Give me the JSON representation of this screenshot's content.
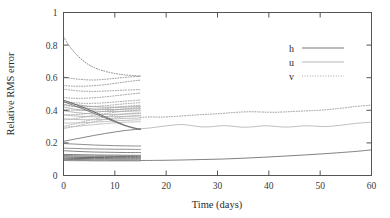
{
  "chart_data": {
    "type": "line",
    "title": "",
    "subtitle": "",
    "xlabel": "Time (days)",
    "ylabel": "Relative RMS error",
    "xlim": [
      0,
      60
    ],
    "ylim": [
      0,
      1
    ],
    "xticks": [
      0,
      10,
      20,
      30,
      40,
      50,
      60
    ],
    "xtick_labels": [
      "0",
      "10",
      "20",
      "30",
      "40",
      "50",
      "60"
    ],
    "yticks": [
      0,
      0.2,
      0.4,
      0.6,
      0.8,
      1
    ],
    "ytick_labels": [
      "0",
      "0.2",
      "0.4",
      "0.6",
      "0.8",
      "1"
    ],
    "grid": false,
    "legend_position": "upper right",
    "legend": [
      {
        "name": "h",
        "style": "solid",
        "color": "#606060"
      },
      {
        "name": "u",
        "style": "solid",
        "color": "#a8a8a8"
      },
      {
        "name": "v",
        "style": "dotted",
        "color": "#909090"
      }
    ],
    "series": [
      {
        "name": "v-forecast",
        "variable": "v",
        "style": "dotted",
        "color": "#8f8f8f",
        "x": [
          15,
          17,
          19,
          21,
          23,
          25,
          27,
          29,
          31,
          33,
          35,
          37,
          39,
          41,
          43,
          45,
          47,
          49,
          51,
          53,
          55,
          57,
          60
        ],
        "y": [
          0.357,
          0.359,
          0.358,
          0.361,
          0.365,
          0.37,
          0.374,
          0.377,
          0.381,
          0.386,
          0.39,
          0.391,
          0.389,
          0.388,
          0.39,
          0.393,
          0.396,
          0.399,
          0.403,
          0.409,
          0.416,
          0.424,
          0.432
        ]
      },
      {
        "name": "u-forecast",
        "variable": "u",
        "style": "solid",
        "color": "#b4b4b4",
        "x": [
          15,
          17,
          19,
          21,
          23,
          25,
          27,
          29,
          31,
          33,
          35,
          37,
          39,
          41,
          43,
          45,
          47,
          49,
          51,
          53,
          55,
          57,
          60
        ],
        "y": [
          0.287,
          0.292,
          0.301,
          0.308,
          0.313,
          0.306,
          0.298,
          0.3,
          0.306,
          0.302,
          0.296,
          0.299,
          0.305,
          0.302,
          0.297,
          0.3,
          0.305,
          0.303,
          0.3,
          0.305,
          0.312,
          0.32,
          0.327
        ]
      },
      {
        "name": "h-forecast",
        "variable": "h",
        "style": "solid",
        "color": "#6a6a6a",
        "x": [
          15,
          19,
          23,
          27,
          31,
          35,
          39,
          43,
          47,
          51,
          55,
          57,
          60
        ],
        "y": [
          0.092,
          0.093,
          0.095,
          0.098,
          0.101,
          0.106,
          0.112,
          0.119,
          0.126,
          0.134,
          0.143,
          0.148,
          0.157
        ]
      },
      {
        "name": "v-ensemble-1",
        "variable": "v",
        "style": "dotted",
        "color": "#7d7d7d",
        "x": [
          0,
          1,
          2,
          3,
          4,
          5,
          6,
          7,
          8,
          9,
          10,
          11,
          12,
          13,
          14,
          15
        ],
        "y": [
          0.852,
          0.8,
          0.76,
          0.727,
          0.7,
          0.678,
          0.662,
          0.65,
          0.64,
          0.632,
          0.626,
          0.621,
          0.617,
          0.614,
          0.612,
          0.61
        ]
      },
      {
        "name": "v-ensemble-2",
        "variable": "v",
        "style": "dotted",
        "color": "#8a8a8a",
        "x": [
          0,
          2,
          4,
          6,
          8,
          10,
          12,
          14,
          15
        ],
        "y": [
          0.604,
          0.594,
          0.588,
          0.586,
          0.59,
          0.596,
          0.602,
          0.607,
          0.609
        ]
      },
      {
        "name": "v-ensemble-3",
        "variable": "v",
        "style": "dotted",
        "color": "#8a8a8a",
        "x": [
          0,
          2,
          4,
          6,
          8,
          10,
          12,
          14,
          15
        ],
        "y": [
          0.552,
          0.548,
          0.548,
          0.551,
          0.557,
          0.565,
          0.574,
          0.582,
          0.585
        ]
      },
      {
        "name": "v-ensemble-4",
        "variable": "v",
        "style": "dotted",
        "color": "#8f8f8f",
        "x": [
          0,
          2,
          4,
          6,
          8,
          10,
          12,
          14,
          15
        ],
        "y": [
          0.53,
          0.522,
          0.517,
          0.516,
          0.518,
          0.521,
          0.524,
          0.526,
          0.527
        ]
      },
      {
        "name": "v-ensemble-5",
        "variable": "v",
        "style": "dotted",
        "color": "#8f8f8f",
        "x": [
          0,
          2,
          4,
          6,
          8,
          10,
          12,
          14,
          15
        ],
        "y": [
          0.478,
          0.474,
          0.474,
          0.477,
          0.482,
          0.489,
          0.496,
          0.503,
          0.506
        ]
      },
      {
        "name": "v-ensemble-6",
        "variable": "v",
        "style": "dotted",
        "color": "#949494",
        "x": [
          0,
          2,
          4,
          6,
          8,
          10,
          12,
          14,
          15
        ],
        "y": [
          0.455,
          0.447,
          0.443,
          0.443,
          0.446,
          0.451,
          0.456,
          0.461,
          0.463
        ]
      },
      {
        "name": "v-ensemble-7",
        "variable": "v",
        "style": "dotted",
        "color": "#949494",
        "x": [
          0,
          2,
          4,
          6,
          8,
          10,
          12,
          14,
          15
        ],
        "y": [
          0.43,
          0.424,
          0.422,
          0.424,
          0.428,
          0.434,
          0.44,
          0.445,
          0.447
        ]
      },
      {
        "name": "v-ensemble-8",
        "variable": "v",
        "style": "dotted",
        "color": "#9a9a9a",
        "x": [
          0,
          2,
          4,
          6,
          8,
          10,
          12,
          14,
          15
        ],
        "y": [
          0.404,
          0.4,
          0.4,
          0.404,
          0.41,
          0.417,
          0.424,
          0.429,
          0.431
        ]
      },
      {
        "name": "v-ensemble-9",
        "variable": "v",
        "style": "dotted",
        "color": "#9a9a9a",
        "x": [
          0,
          2,
          4,
          6,
          8,
          10,
          12,
          14,
          15
        ],
        "y": [
          0.372,
          0.373,
          0.378,
          0.386,
          0.394,
          0.402,
          0.409,
          0.414,
          0.416
        ]
      },
      {
        "name": "v-ensemble-10",
        "variable": "v",
        "style": "dotted",
        "color": "#9f9f9f",
        "x": [
          0,
          2,
          4,
          6,
          8,
          10,
          12,
          14,
          15
        ],
        "y": [
          0.341,
          0.348,
          0.358,
          0.369,
          0.379,
          0.388,
          0.395,
          0.4,
          0.402
        ]
      },
      {
        "name": "v-ensemble-11",
        "variable": "v",
        "style": "dotted",
        "color": "#9f9f9f",
        "x": [
          0,
          2,
          4,
          6,
          8,
          10,
          12,
          14,
          15
        ],
        "y": [
          0.302,
          0.315,
          0.331,
          0.346,
          0.359,
          0.37,
          0.378,
          0.383,
          0.385
        ]
      },
      {
        "name": "v-ensemble-12",
        "variable": "v",
        "style": "dotted",
        "color": "#a4a4a4",
        "x": [
          0,
          2,
          4,
          6,
          8,
          10,
          12,
          14,
          15
        ],
        "y": [
          0.287,
          0.3,
          0.315,
          0.33,
          0.343,
          0.353,
          0.361,
          0.366,
          0.368
        ]
      },
      {
        "name": "u-ensemble-1",
        "variable": "u",
        "style": "solid",
        "color": "#9e9e9e",
        "x": [
          0,
          2,
          4,
          6,
          8,
          10,
          12,
          14,
          15
        ],
        "y": [
          0.452,
          0.438,
          0.428,
          0.422,
          0.419,
          0.419,
          0.42,
          0.422,
          0.423
        ]
      },
      {
        "name": "u-ensemble-2",
        "variable": "u",
        "style": "solid",
        "color": "#a3a3a3",
        "x": [
          0,
          2,
          4,
          6,
          8,
          10,
          12,
          14,
          15
        ],
        "y": [
          0.438,
          0.424,
          0.414,
          0.408,
          0.405,
          0.405,
          0.407,
          0.409,
          0.41
        ]
      },
      {
        "name": "u-ensemble-3",
        "variable": "u",
        "style": "solid",
        "color": "#a8a8a8",
        "x": [
          0,
          2,
          4,
          6,
          8,
          10,
          12,
          14,
          15
        ],
        "y": [
          0.42,
          0.408,
          0.4,
          0.395,
          0.393,
          0.393,
          0.394,
          0.396,
          0.397
        ]
      },
      {
        "name": "u-ensemble-4",
        "variable": "u",
        "style": "solid",
        "color": "#adadad",
        "x": [
          0,
          2,
          4,
          6,
          8,
          10,
          12,
          14,
          15
        ],
        "y": [
          0.398,
          0.388,
          0.381,
          0.377,
          0.375,
          0.375,
          0.377,
          0.379,
          0.38
        ]
      },
      {
        "name": "u-ensemble-5",
        "variable": "u",
        "style": "solid",
        "color": "#b0b0b0",
        "x": [
          0,
          2,
          4,
          6,
          8,
          10,
          12,
          14,
          15
        ],
        "y": [
          0.372,
          0.366,
          0.362,
          0.36,
          0.36,
          0.361,
          0.363,
          0.365,
          0.366
        ]
      },
      {
        "name": "u-ensemble-6",
        "variable": "u",
        "style": "solid",
        "color": "#b4b4b4",
        "x": [
          0,
          2,
          4,
          6,
          8,
          10,
          12,
          14,
          15
        ],
        "y": [
          0.348,
          0.344,
          0.342,
          0.342,
          0.344,
          0.347,
          0.35,
          0.352,
          0.353
        ]
      },
      {
        "name": "u-ensemble-7",
        "variable": "u",
        "style": "solid",
        "color": "#b8b8b8",
        "x": [
          0,
          2,
          4,
          6,
          8,
          10,
          12,
          14,
          15
        ],
        "y": [
          0.322,
          0.322,
          0.324,
          0.327,
          0.331,
          0.335,
          0.338,
          0.341,
          0.342
        ]
      },
      {
        "name": "u-ensemble-8",
        "variable": "u",
        "style": "solid",
        "color": "#bcbcbc",
        "x": [
          0,
          2,
          4,
          6,
          8,
          10,
          12,
          14,
          15
        ],
        "y": [
          0.296,
          0.3,
          0.306,
          0.312,
          0.318,
          0.323,
          0.327,
          0.329,
          0.33
        ]
      },
      {
        "name": "h-ensemble-descending-1",
        "variable": "h",
        "style": "solid",
        "color": "#585858",
        "x": [
          0,
          2,
          4,
          6,
          8,
          10,
          12,
          14,
          15
        ],
        "y": [
          0.462,
          0.44,
          0.416,
          0.39,
          0.362,
          0.334,
          0.308,
          0.29,
          0.285
        ]
      },
      {
        "name": "h-ensemble-descending-2",
        "variable": "h",
        "style": "solid",
        "color": "#6e6e6e",
        "x": [
          0,
          2,
          4,
          6,
          8,
          10,
          12,
          14,
          15
        ],
        "y": [
          0.452,
          0.43,
          0.406,
          0.381,
          0.355,
          0.329,
          0.305,
          0.288,
          0.284
        ]
      },
      {
        "name": "h-ensemble-ascending-1",
        "variable": "h",
        "style": "solid",
        "color": "#707070",
        "x": [
          0,
          2,
          4,
          6,
          8,
          10,
          12,
          14,
          15
        ],
        "y": [
          0.21,
          0.222,
          0.234,
          0.246,
          0.257,
          0.267,
          0.276,
          0.282,
          0.284
        ]
      },
      {
        "name": "h-ensemble-flat-1",
        "variable": "h",
        "style": "solid",
        "color": "#787878",
        "x": [
          0,
          2,
          4,
          6,
          8,
          10,
          12,
          14,
          15
        ],
        "y": [
          0.196,
          0.193,
          0.19,
          0.187,
          0.185,
          0.183,
          0.182,
          0.181,
          0.181
        ]
      },
      {
        "name": "h-ensemble-flat-2",
        "variable": "h",
        "style": "solid",
        "color": "#7d7d7d",
        "x": [
          0,
          2,
          4,
          6,
          8,
          10,
          12,
          14,
          15
        ],
        "y": [
          0.168,
          0.166,
          0.164,
          0.163,
          0.162,
          0.161,
          0.161,
          0.16,
          0.16
        ]
      },
      {
        "name": "h-ensemble-flat-3",
        "variable": "h",
        "style": "solid",
        "color": "#6c6c6c",
        "x": [
          0,
          2,
          4,
          6,
          8,
          10,
          12,
          14,
          15
        ],
        "y": [
          0.152,
          0.149,
          0.146,
          0.144,
          0.143,
          0.142,
          0.141,
          0.141,
          0.141
        ]
      },
      {
        "name": "h-ensemble-bundle-1",
        "variable": "h",
        "style": "solid",
        "color": "#5e5e5e",
        "x": [
          0,
          2,
          4,
          6,
          8,
          10,
          12,
          14,
          15
        ],
        "y": [
          0.13,
          0.128,
          0.127,
          0.126,
          0.125,
          0.125,
          0.124,
          0.124,
          0.124
        ]
      },
      {
        "name": "h-ensemble-bundle-2",
        "variable": "h",
        "style": "solid",
        "color": "#4f4f4f",
        "x": [
          0,
          2,
          4,
          6,
          8,
          10,
          12,
          14,
          15
        ],
        "y": [
          0.122,
          0.12,
          0.119,
          0.118,
          0.118,
          0.117,
          0.117,
          0.117,
          0.117
        ]
      },
      {
        "name": "h-ensemble-bundle-3",
        "variable": "h",
        "style": "solid",
        "color": "#464646",
        "x": [
          0,
          2,
          4,
          6,
          8,
          10,
          12,
          14,
          15
        ],
        "y": [
          0.114,
          0.112,
          0.111,
          0.11,
          0.11,
          0.109,
          0.109,
          0.109,
          0.109
        ]
      },
      {
        "name": "h-ensemble-bundle-4",
        "variable": "h",
        "style": "solid",
        "color": "#515151",
        "x": [
          0,
          2,
          4,
          6,
          8,
          10,
          12,
          14,
          15
        ],
        "y": [
          0.106,
          0.105,
          0.104,
          0.103,
          0.103,
          0.102,
          0.102,
          0.102,
          0.102
        ]
      },
      {
        "name": "h-ensemble-bundle-5",
        "variable": "h",
        "style": "solid",
        "color": "#626262",
        "x": [
          0,
          2,
          4,
          6,
          8,
          10,
          12,
          14,
          15
        ],
        "y": [
          0.099,
          0.098,
          0.097,
          0.096,
          0.096,
          0.095,
          0.095,
          0.095,
          0.095
        ]
      },
      {
        "name": "h-ensemble-bundle-6",
        "variable": "h",
        "style": "solid",
        "color": "#6f6f6f",
        "x": [
          0,
          2,
          4,
          6,
          8,
          10,
          12,
          14,
          15
        ],
        "y": [
          0.092,
          0.091,
          0.091,
          0.09,
          0.09,
          0.09,
          0.09,
          0.09,
          0.09
        ]
      }
    ]
  }
}
